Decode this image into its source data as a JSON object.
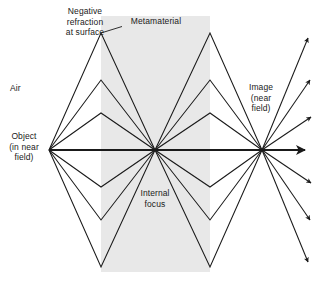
{
  "figure": {
    "background": "#ffffff",
    "slab_fill": "#e8e8e8",
    "ray_color": "#1a1a1a",
    "text_color": "#1a1a1a"
  },
  "labels": {
    "negative_refraction": "Negative\nrefraction\nat surface",
    "metamaterial": "Metamaterial",
    "air": "Air",
    "object": "Object\n(in near\nfield)",
    "image": "Image\n(near\nfield)",
    "internal_focus": "Internal\nfocus"
  },
  "geometry": {
    "slab": {
      "x_left": 101,
      "x_right": 210,
      "y_top": 16,
      "y_bottom": 272
    },
    "object_point": {
      "x": 49,
      "y": 150
    },
    "internal_focus_point": {
      "x": 155,
      "y": 150
    },
    "image_point": {
      "x": 262,
      "y": 150
    },
    "axis_y": 150,
    "left_surface_vertices_y": [
      33,
      80,
      113,
      187,
      220,
      267
    ],
    "right_surface_vertices_y": [
      33,
      80,
      113,
      187,
      220,
      267
    ],
    "exit_ray_end_points": [
      {
        "x": 311,
        "y": 58
      },
      {
        "x": 311,
        "y": 92
      },
      {
        "x": 311,
        "y": 120
      },
      {
        "x": 311,
        "y": 150
      },
      {
        "x": 311,
        "y": 180
      },
      {
        "x": 311,
        "y": 208
      },
      {
        "x": 311,
        "y": 242
      }
    ],
    "leader_line": {
      "x1": 122,
      "y1": 28,
      "x2": 101,
      "y2": 33
    }
  }
}
